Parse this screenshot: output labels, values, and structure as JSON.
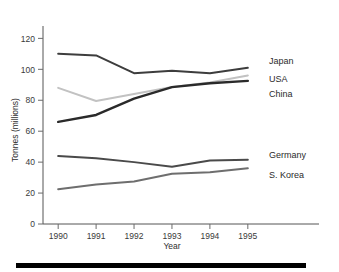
{
  "chart_data": {
    "type": "line",
    "title": "",
    "xlabel": "Year",
    "ylabel": "Tonnes (millions)",
    "categories": [
      "1990",
      "1991",
      "1992",
      "1993",
      "1994",
      "1995"
    ],
    "x": [
      1990,
      1991,
      1992,
      1993,
      1994,
      1995
    ],
    "xlim": [
      1989.6,
      1995.4
    ],
    "ylim": [
      0,
      128
    ],
    "yticks": [
      0,
      20,
      40,
      60,
      80,
      100,
      120
    ],
    "ytick_labels": [
      "0",
      "20",
      "40",
      "60",
      "80",
      "100",
      "120"
    ],
    "xtick_labels": [
      "1990",
      "1991",
      "1992",
      "1993",
      "1994",
      "1995"
    ],
    "grid": false,
    "legend_position": "right-inline-labels",
    "series": [
      {
        "name": "Japan",
        "label": "Japan",
        "color": "#3d3d3d",
        "width": 2.0,
        "values": [
          110,
          109,
          97.5,
          99,
          97.5,
          101
        ]
      },
      {
        "name": "USA",
        "label": "USA",
        "color": "#c2c2c2",
        "width": 2.0,
        "values": [
          88,
          79.5,
          84,
          88.5,
          91.5,
          96
        ]
      },
      {
        "name": "China",
        "label": "China",
        "color": "#2a2a2a",
        "width": 2.4,
        "values": [
          66,
          70.5,
          81,
          88.5,
          91,
          92.5
        ]
      },
      {
        "name": "Germany",
        "label": "Germany",
        "color": "#4a4a4a",
        "width": 2.0,
        "values": [
          44,
          42.5,
          40,
          37,
          41,
          41.5
        ]
      },
      {
        "name": "S. Korea",
        "label": "S. Korea",
        "color": "#6e6e6e",
        "width": 2.0,
        "values": [
          22.5,
          25.5,
          27.5,
          32.5,
          33.5,
          36
        ]
      }
    ]
  },
  "axes": {
    "y_axis_title": "Tonnes (millions)",
    "x_axis_title": "Year"
  },
  "colors": {
    "axis": "#555555",
    "text": "#2e2e2e",
    "background": "#ffffff",
    "footer_bar": "#000000"
  }
}
